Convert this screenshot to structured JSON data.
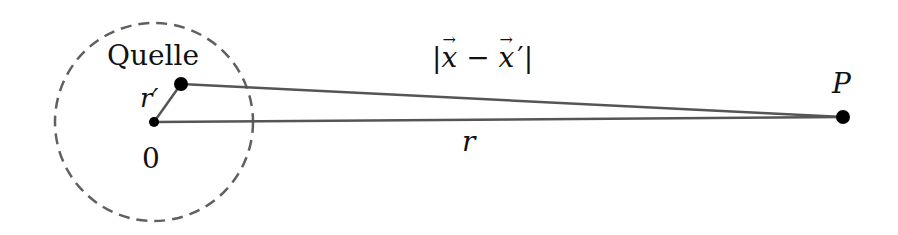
{
  "diagram": {
    "type": "geometry",
    "labels": {
      "source": "Quelle",
      "origin": "0",
      "r_prime": "r′",
      "distance": "|x − x ′|",
      "distance_parts": {
        "open": "|",
        "x1": "x",
        "minus": "−",
        "x2": "x",
        "prime": "′",
        "close": "|"
      },
      "r": "r",
      "point": "P"
    },
    "points": {
      "origin": {
        "x": 154,
        "y": 122
      },
      "source": {
        "x": 181,
        "y": 84
      },
      "P": {
        "x": 843,
        "y": 117
      }
    },
    "circle": {
      "cx": 154,
      "cy": 122,
      "r": 99,
      "style": "dashed"
    },
    "colors": {
      "line": "#555555",
      "dot": "#000000",
      "circle": "#606060",
      "text": "#111111"
    }
  }
}
